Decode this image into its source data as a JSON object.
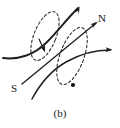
{
  "figure": {
    "caption": "(b)",
    "background_color": "#ffffff",
    "stroke_color": "#1f1f1f",
    "dashed_color": "#2a2a2a",
    "width": 120,
    "height": 128,
    "labels": [
      {
        "id": "north-pole",
        "text": "N",
        "x": 100,
        "y": 20
      },
      {
        "id": "south-pole",
        "text": "S",
        "x": 14,
        "y": 90
      }
    ],
    "field_lines": [
      {
        "id": "field-line-upper-left",
        "description": "thick solid curve entering from left edge, bending up-right, arrow at top right",
        "arrow": "up-right"
      },
      {
        "id": "field-line-n-axis",
        "description": "solid straight line from lower-left S label toward upper-right N label",
        "arrow": "up-right"
      },
      {
        "id": "field-line-right",
        "description": "solid curve from lower-left sweeping to the right edge",
        "arrow": "right"
      },
      {
        "id": "field-line-short-down",
        "description": "short solid segment with arrowhead pointing down into the loop centre",
        "arrow": "down"
      }
    ],
    "loops": [
      {
        "id": "dashed-loop-left",
        "description": "dashed elliptical current loop, tilted, upper-left of centre"
      },
      {
        "id": "dashed-loop-right",
        "description": "dashed elliptical current loop, tilted, lower-right of centre"
      }
    ],
    "markers": [
      {
        "id": "loop-point-right",
        "x": 73,
        "y": 85,
        "description": "filled dot on right dashed loop"
      }
    ]
  }
}
